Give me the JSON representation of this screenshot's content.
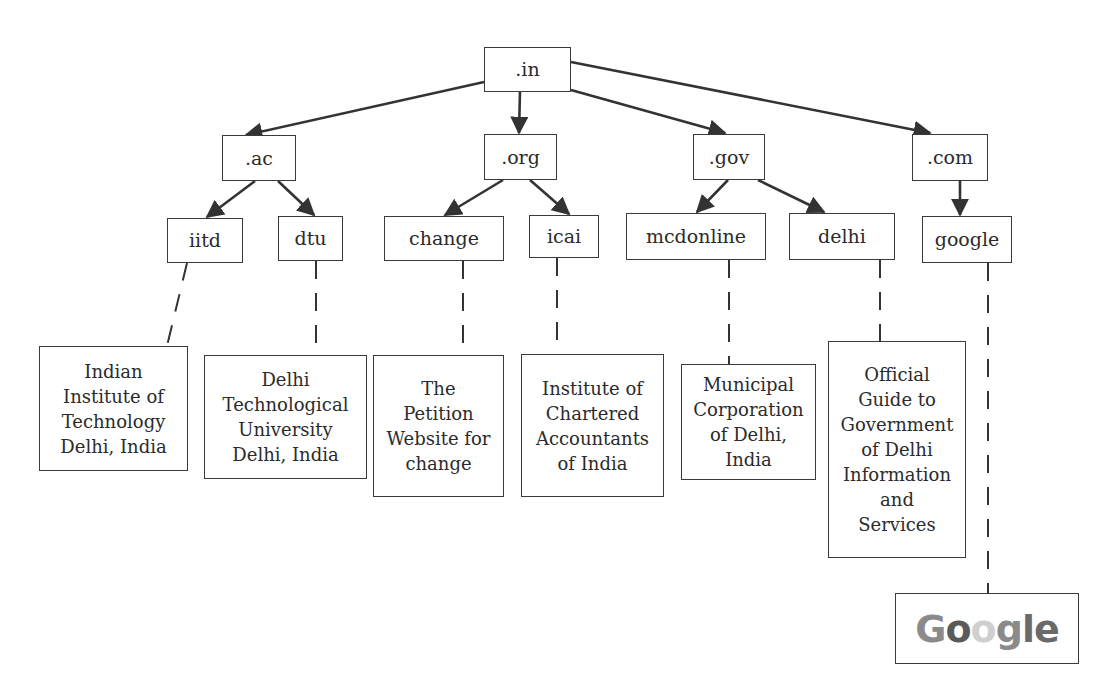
{
  "diagram": {
    "type": "domain-name-hierarchy",
    "colors": {
      "line": "#333333",
      "border": "#3a3a3a",
      "text": "#2b2b2b"
    },
    "root": {
      "id": "in",
      "label": ".in"
    },
    "second_level": [
      {
        "id": "ac",
        "label": ".ac"
      },
      {
        "id": "org",
        "label": ".org"
      },
      {
        "id": "gov",
        "label": ".gov"
      },
      {
        "id": "com",
        "label": ".com"
      }
    ],
    "third_level": [
      {
        "id": "iitd",
        "label": "iitd",
        "parent": ".ac"
      },
      {
        "id": "dtu",
        "label": "dtu",
        "parent": ".ac"
      },
      {
        "id": "change",
        "label": "change",
        "parent": ".org"
      },
      {
        "id": "icai",
        "label": "icai",
        "parent": ".org"
      },
      {
        "id": "mcdonline",
        "label": "mcdonline",
        "parent": ".gov"
      },
      {
        "id": "delhi",
        "label": "delhi",
        "parent": ".gov"
      },
      {
        "id": "google",
        "label": "google",
        "parent": ".com"
      }
    ],
    "descriptions": [
      {
        "for": "iitd",
        "lines": [
          "Indian",
          "Institute of",
          "Technology",
          "Delhi, India"
        ]
      },
      {
        "for": "dtu",
        "lines": [
          "Delhi",
          "Technological",
          "University",
          "Delhi, India"
        ]
      },
      {
        "for": "change",
        "lines": [
          "The",
          "Petition",
          "Website for",
          "change"
        ]
      },
      {
        "for": "icai",
        "lines": [
          "Institute of",
          "Chartered",
          "Accountants",
          "of India"
        ]
      },
      {
        "for": "mcdonline",
        "lines": [
          "Municipal",
          "Corporation",
          "of Delhi,",
          "India"
        ]
      },
      {
        "for": "delhi",
        "lines": [
          "Official",
          "Guide to",
          "Government",
          "of Delhi",
          "Information",
          "and",
          "Services"
        ]
      },
      {
        "for": "google",
        "logo_text": [
          "G",
          "o",
          "o",
          "g",
          "l",
          "e"
        ]
      }
    ]
  }
}
